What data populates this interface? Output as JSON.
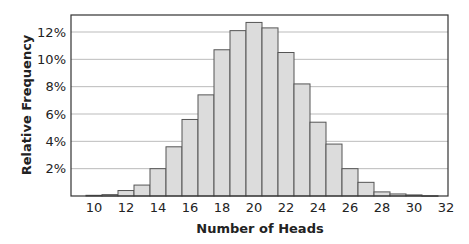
{
  "chart_data": {
    "type": "bar",
    "title": "",
    "xlabel": "Number of Heads",
    "ylabel": "Relative Frequency",
    "categories": [
      10,
      11,
      12,
      13,
      14,
      15,
      16,
      17,
      18,
      19,
      20,
      21,
      22,
      23,
      24,
      25,
      26,
      27,
      28,
      29,
      30,
      31
    ],
    "values": [
      0.05,
      0.1,
      0.4,
      0.8,
      2.0,
      3.6,
      5.6,
      7.4,
      10.7,
      12.1,
      12.7,
      12.3,
      10.5,
      8.2,
      5.4,
      3.8,
      2.0,
      1.0,
      0.3,
      0.15,
      0.08,
      0.02
    ],
    "value_unit": "%",
    "ylim": [
      0,
      13.3
    ],
    "yticks": [
      2,
      4,
      6,
      8,
      10,
      12
    ],
    "ytick_labels": [
      "2%",
      "4%",
      "6%",
      "8%",
      "10%",
      "12%"
    ],
    "xlim": [
      9.5,
      32.4
    ],
    "xticks": [
      10,
      12,
      14,
      16,
      18,
      20,
      22,
      24,
      26,
      28,
      30,
      32
    ],
    "xtick_labels": [
      "10",
      "12",
      "14",
      "16",
      "18",
      "20",
      "22",
      "24",
      "26",
      "28",
      "30",
      "32"
    ],
    "grid": "horizontal",
    "legend": null,
    "colors": {
      "bar_fill": "#dcdcdc",
      "bar_edge": "#555555",
      "grid": "#aaaaaa",
      "axis": "#333333"
    }
  }
}
